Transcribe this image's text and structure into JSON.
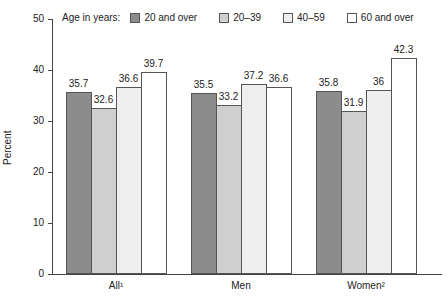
{
  "chart_data": {
    "type": "bar",
    "title": "",
    "xlabel": "",
    "ylabel": "Percent",
    "ylim": [
      0,
      50
    ],
    "yticks": [
      0,
      10,
      20,
      30,
      40,
      50
    ],
    "categories": [
      "All¹",
      "Men",
      "Women²"
    ],
    "legend_title": "Age in years:",
    "series": [
      {
        "name": "20 and over",
        "color": "#8c8c8c",
        "values": [
          35.7,
          35.5,
          35.8
        ]
      },
      {
        "name": "20–39",
        "color": "#cfcfcf",
        "values": [
          32.6,
          33.2,
          31.9
        ]
      },
      {
        "name": "40–59",
        "color": "#eeeeee",
        "values": [
          36.6,
          37.2,
          36.0
        ]
      },
      {
        "name": "60 and over",
        "color": "#ffffff",
        "values": [
          39.7,
          36.6,
          42.3
        ]
      }
    ]
  }
}
